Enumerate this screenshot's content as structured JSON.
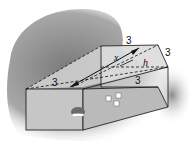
{
  "diagram": {
    "type": "3d-geometry",
    "labels": {
      "top_edge": "3",
      "right_slant_edge": "3",
      "left_top_edge": "3",
      "inner_bottom_edge": "3",
      "diagonal": "x",
      "height": "h"
    },
    "colors": {
      "shadow": "#9a9a9a",
      "face_front": "#c8c8c8",
      "face_side": "#bdbdbd",
      "face_top": "#d9d9d9",
      "edge": "#111111"
    }
  }
}
